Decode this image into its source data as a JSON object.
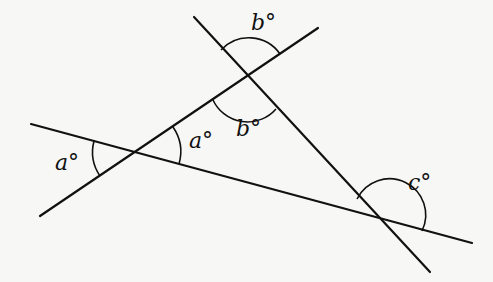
{
  "diagram": {
    "type": "three intersecting lines with marked angles",
    "lines": [
      {
        "id": "long-line",
        "from": [
          31,
          124
        ],
        "to": [
          472,
          243
        ]
      },
      {
        "id": "upper-line",
        "from": [
          40,
          216
        ],
        "to": [
          318,
          28
        ]
      },
      {
        "id": "steep-line",
        "from": [
          194,
          17
        ],
        "to": [
          430,
          272
        ]
      }
    ],
    "labels": {
      "a_left": "a°",
      "a_right": "a°",
      "b_top": "b°",
      "b_bottom": "b°",
      "c": "c°"
    }
  }
}
